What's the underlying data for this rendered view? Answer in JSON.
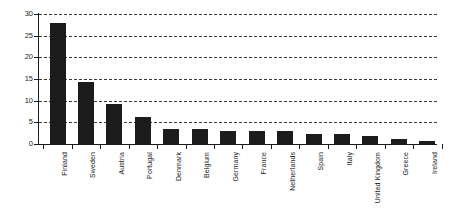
{
  "chart_data": {
    "type": "bar",
    "title": "",
    "subtitle": "",
    "xlabel": "",
    "ylabel": "",
    "ylim": [
      0,
      30
    ],
    "yticks": [
      0,
      5,
      10,
      15,
      20,
      25,
      30
    ],
    "ytick_labels": [
      "0",
      "5",
      "10",
      "15",
      "20",
      "25",
      "30"
    ],
    "grid": true,
    "grid_style": "dashed-horizontal",
    "legend": "none",
    "bar_color": "#1c1c1c",
    "categories": [
      "Finland",
      "Sweden",
      "Austria",
      "Portugal",
      "Denmark",
      "Belgium",
      "Germany",
      "France",
      "Netherlands",
      "Spain",
      "Italy",
      "United Kingdom",
      "Greece",
      "Ireland"
    ],
    "values": [
      28.0,
      14.3,
      9.2,
      6.3,
      3.5,
      3.5,
      3.0,
      3.0,
      3.0,
      2.4,
      2.4,
      1.8,
      1.2,
      0.6
    ]
  }
}
